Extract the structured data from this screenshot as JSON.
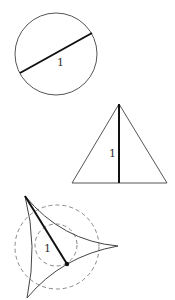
{
  "figures": [
    {
      "name": "circle-diameter",
      "label": "1"
    },
    {
      "name": "triangle-altitude",
      "label": "1"
    },
    {
      "name": "deltoid-width",
      "label": "1"
    }
  ],
  "colors": {
    "stroke": "#555555",
    "bold": "#111111",
    "dash": "#888888"
  }
}
